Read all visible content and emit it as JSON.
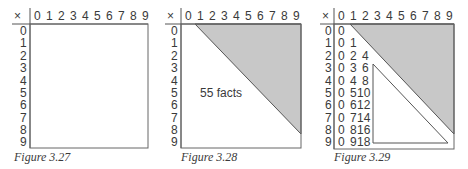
{
  "axis_symbol": "×",
  "col_labels": [
    "0",
    "1",
    "2",
    "3",
    "4",
    "5",
    "6",
    "7",
    "8",
    "9"
  ],
  "row_labels": [
    "0",
    "1",
    "2",
    "3",
    "4",
    "5",
    "6",
    "7",
    "8",
    "9"
  ],
  "colors": {
    "line": "#555555",
    "shade": "#c8c8c8",
    "text": "#3a3a3a"
  },
  "figures": [
    {
      "caption": "Figure 3.27",
      "note": ""
    },
    {
      "caption": "Figure 3.28",
      "note": "55 facts"
    },
    {
      "caption": "Figure 3.29",
      "note": "",
      "column_0": [
        "0",
        "0",
        "0",
        "0",
        "0",
        "0",
        "0",
        "0",
        "0",
        "0"
      ],
      "column_1": [
        "1",
        "2",
        "3",
        "4",
        "5",
        "6",
        "7",
        "8",
        "9"
      ],
      "column_2": [
        "4",
        "6",
        "8",
        "10",
        "12",
        "14",
        "16",
        "18"
      ]
    }
  ]
}
